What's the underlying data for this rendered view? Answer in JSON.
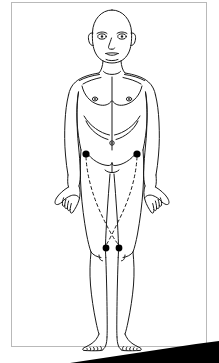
{
  "document": {
    "kind": "scanned-anatomical-illustration",
    "title": "Anterior full-body male figure with marked reference points",
    "caption": "",
    "page_background_color": "#ffffff",
    "ink_color": "#1a1a1a",
    "frame_color": "#b9b9b9",
    "marker_color": "#000000",
    "scan_shadow_color": "#000000"
  },
  "figure": {
    "name": "male-anterior-body-outline",
    "view": "anterior",
    "sex": "male",
    "style": "line-drawing",
    "features": [
      "bald-head",
      "face-eyes-nose-mouth-ears",
      "neck",
      "clavicles",
      "shoulders",
      "pectorals",
      "nipples",
      "rib-cage-contour",
      "midline-linea-alba",
      "navel",
      "inguinal-creases",
      "arms-at-sides",
      "hands-with-fingers",
      "thighs",
      "knees",
      "lower-legs",
      "feet-with-toes"
    ]
  },
  "markers": {
    "label": "Marked points",
    "color": "#000000",
    "radius_px": 3.4,
    "points": [
      {
        "id": "point-left-hip",
        "name": "left-inguinal-point",
        "x": 86,
        "y": 154,
        "r": 3.6
      },
      {
        "id": "point-right-hip",
        "name": "right-inguinal-point",
        "x": 137,
        "y": 154,
        "r": 3.6
      },
      {
        "id": "point-left-knee",
        "name": "left-knee-point",
        "x": 106,
        "y": 248,
        "r": 3.4
      },
      {
        "id": "point-right-knee",
        "name": "right-knee-point",
        "x": 119,
        "y": 248,
        "r": 3.4
      }
    ],
    "navel": {
      "id": "navel-point",
      "name": "navel",
      "x": 112,
      "y": 143,
      "r": 2.0,
      "filled": false
    }
  },
  "connections": {
    "label": "Dashed reference pathways",
    "style": "dashed",
    "dash_pattern": "3 3",
    "stroke_width": 1,
    "color": "#1a1a1a",
    "paths": [
      {
        "id": "path-left-hip-to-right-knee",
        "name": "left-hip-to-right-knee-pathway",
        "from": "point-left-hip",
        "to": "point-right-knee",
        "d": "M 86 157 C 87 178, 94 200, 104 220 C 110 232, 115 241, 119 245"
      },
      {
        "id": "path-right-hip-to-left-knee",
        "name": "right-hip-to-left-knee-pathway",
        "from": "point-right-hip",
        "to": "point-left-knee",
        "d": "M 137 157 C 136 178, 129 200, 119 220 C 113 232, 109 241, 106 245"
      }
    ]
  },
  "scan_artifact": {
    "name": "page-edge-shadow",
    "description": "black triangular shadow along the lower-right page edge",
    "polygon": "70,363 219,363 219,341 196,344"
  }
}
